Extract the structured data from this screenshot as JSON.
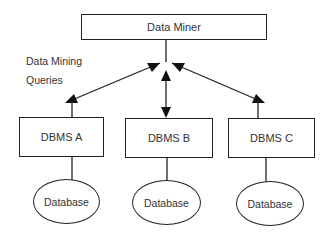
{
  "diagram": {
    "top_node": "Data Miner",
    "annotation": {
      "line1": "Data Mining",
      "line2": "Queries"
    },
    "dbms_nodes": [
      "DBMS A",
      "DBMS B",
      "DBMS C"
    ],
    "database_nodes": [
      "Database",
      "Database",
      "Database"
    ],
    "edges": [
      {
        "from": "Data Miner",
        "to": "DBMS A",
        "type": "bidirectional-arrow"
      },
      {
        "from": "Data Miner",
        "to": "DBMS B",
        "type": "bidirectional-arrow"
      },
      {
        "from": "Data Miner",
        "to": "DBMS C",
        "type": "bidirectional-arrow"
      },
      {
        "from": "DBMS A",
        "to": "Database",
        "type": "line"
      },
      {
        "from": "DBMS B",
        "to": "Database",
        "type": "line"
      },
      {
        "from": "DBMS C",
        "to": "Database",
        "type": "line"
      }
    ]
  }
}
